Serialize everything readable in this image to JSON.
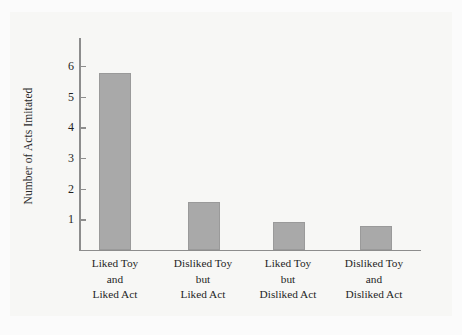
{
  "chart_data": {
    "type": "bar",
    "title": "",
    "subtitle": "",
    "xlabel": "",
    "ylabel": "Number of Acts Imitated",
    "ylim": [
      0,
      6.5
    ],
    "yticks": [
      1,
      2,
      3,
      4,
      5,
      6
    ],
    "grid": false,
    "legend": false,
    "bar_color": "#a9a9a9",
    "categories": [
      "Liked Toy and Liked Act",
      "Disliked Toy but Liked Act",
      "Liked Toy but Disliked Act",
      "Disliked Toy and Disliked Act"
    ],
    "category_lines": [
      [
        "Liked Toy",
        "and",
        "Liked Act"
      ],
      [
        "Disliked Toy",
        "but",
        "Liked Act"
      ],
      [
        "Liked Toy",
        "but",
        "Disliked Act"
      ],
      [
        "Disliked Toy",
        "and",
        "Disliked Act"
      ]
    ],
    "values": [
      5.75,
      1.55,
      0.9,
      0.78
    ]
  },
  "axis": {
    "y_title": "Number of Acts Imitated",
    "tick_labels": [
      "6",
      "5",
      "4",
      "3",
      "2",
      "1"
    ]
  },
  "categories": {
    "c0": {
      "l0": "Liked Toy",
      "l1": "and",
      "l2": "Liked Act"
    },
    "c1": {
      "l0": "Disliked Toy",
      "l1": "but",
      "l2": "Liked Act"
    },
    "c2": {
      "l0": "Liked Toy",
      "l1": "but",
      "l2": "Disliked Act"
    },
    "c3": {
      "l0": "Disliked Toy",
      "l1": "and",
      "l2": "Disliked Act"
    }
  }
}
